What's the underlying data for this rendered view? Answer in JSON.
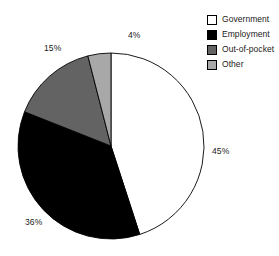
{
  "chart_data": {
    "type": "pie",
    "title": "",
    "subtitle": "",
    "xlabel": "",
    "ylabel": "",
    "grid": false,
    "legend_position": "top-right",
    "start_angle_deg": 0,
    "direction": "clockwise",
    "categories": [
      "Government",
      "Employment",
      "Out-of-pocket",
      "Other"
    ],
    "values": [
      45,
      36,
      15,
      4
    ],
    "value_unit": "%",
    "data_labels": [
      "45%",
      "36%",
      "15%",
      "4%"
    ],
    "slices": [
      {
        "label": "Government",
        "value": 45,
        "data_label": "45%",
        "color": "#ffffff"
      },
      {
        "label": "Employment",
        "value": 36,
        "data_label": "36%",
        "color": "#000000"
      },
      {
        "label": "Out-of-pocket",
        "value": 15,
        "data_label": "15%",
        "color": "#636363"
      },
      {
        "label": "Other",
        "value": 4,
        "data_label": "4%",
        "color": "#a8a8a8"
      }
    ]
  },
  "legend": {
    "items": [
      {
        "label": "Government",
        "color": "#ffffff"
      },
      {
        "label": "Employment",
        "color": "#000000"
      },
      {
        "label": "Out-of-pocket",
        "color": "#636363"
      },
      {
        "label": "Other",
        "color": "#a8a8a8"
      }
    ]
  },
  "pie_geometry": {
    "center_x": 111,
    "center_y": 146,
    "radius": 93,
    "stroke": "#000000",
    "stroke_width": 0.9
  },
  "labels": {
    "government": "45%",
    "employment": "36%",
    "out_of_pocket": "15%",
    "other": "4%"
  }
}
